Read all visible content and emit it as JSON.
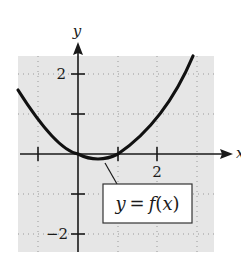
{
  "graph": {
    "axis_labels": {
      "x": "x",
      "y": "y"
    },
    "x_ticks": [
      {
        "value": -1,
        "label": ""
      },
      {
        "value": 1,
        "label": ""
      },
      {
        "value": 2,
        "label": "2"
      }
    ],
    "y_ticks": [
      {
        "value": 2,
        "label": "2"
      },
      {
        "value": 1,
        "label": ""
      },
      {
        "value": -1,
        "label": ""
      },
      {
        "value": -2,
        "label": "−2"
      }
    ],
    "curve_label": "y = f(x)",
    "curve_label_parts": {
      "y": "y",
      "eq": "=",
      "f": "f",
      "open": "(",
      "x": "x",
      "close": ")"
    },
    "colors": {
      "grid_background": "#e6e6e6",
      "curve": "#111111",
      "axis": "#1a1a1a",
      "grid_dots": "#9a9a9a",
      "label_box": "#ffffff"
    }
  }
}
